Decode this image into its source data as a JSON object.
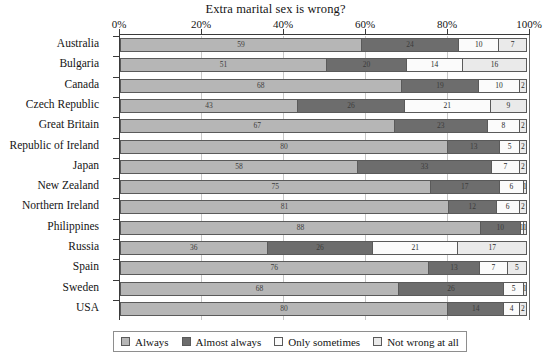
{
  "chart_data": {
    "type": "bar",
    "orientation": "horizontal",
    "stacked": true,
    "normalized_percent": true,
    "title": "Extra marital sex is wrong?",
    "xlabel": "",
    "ylabel": "",
    "xlim": [
      0,
      100
    ],
    "xticks": [
      0,
      20,
      40,
      60,
      80,
      100
    ],
    "xtick_labels": [
      "0%",
      "20%",
      "40%",
      "60%",
      "80%",
      "100%"
    ],
    "grid": true,
    "legend_position": "bottom",
    "categories": [
      "Australia",
      "Bulgaria",
      "Canada",
      "Czech Republic",
      "Great Britain",
      "Republic of Ireland",
      "Japan",
      "New Zealand",
      "Northern Ireland",
      "Philippines",
      "Russia",
      "Spain",
      "Sweden",
      "USA"
    ],
    "series": [
      {
        "name": "Always",
        "color": "#b6b6b6",
        "values": [
          59,
          51,
          68,
          43,
          67,
          80,
          58,
          75,
          81,
          88,
          36,
          76,
          68,
          80
        ]
      },
      {
        "name": "Almost always",
        "color": "#6d6d6d",
        "values": [
          24,
          20,
          19,
          26,
          23,
          13,
          33,
          17,
          12,
          10,
          26,
          13,
          26,
          14
        ]
      },
      {
        "name": "Only sometimes",
        "color": "#fbfbfb",
        "values": [
          10,
          14,
          10,
          21,
          8,
          5,
          7,
          6,
          6,
          1,
          21,
          7,
          5,
          4
        ]
      },
      {
        "name": "Not wrong at all",
        "color": "#eaeaea",
        "values": [
          7,
          16,
          2,
          9,
          2,
          2,
          2,
          1,
          2,
          1,
          17,
          5,
          1,
          2
        ]
      }
    ],
    "data_labels_shown": true
  },
  "legend": {
    "items": [
      {
        "label": "Always",
        "color": "#b6b6b6"
      },
      {
        "label": "Almost always",
        "color": "#6d6d6d"
      },
      {
        "label": "Only sometimes",
        "color": "#fbfbfb"
      },
      {
        "label": "Not wrong at all",
        "color": "#eaeaea"
      }
    ]
  }
}
